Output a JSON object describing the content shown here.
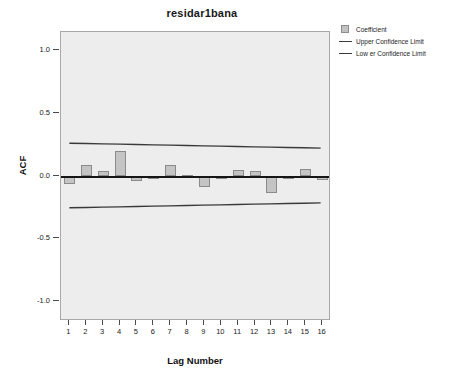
{
  "chart_data": {
    "type": "bar",
    "title": "residar1bana",
    "xlabel": "Lag Number",
    "ylabel": "ACF",
    "grid": false,
    "legend_position": "top-right",
    "xlim": [
      0.5,
      16.5
    ],
    "ylim": [
      -1.15,
      1.15
    ],
    "ytick_values": [
      1.0,
      0.5,
      0.0,
      -0.5,
      -1.0
    ],
    "ytick_labels": [
      "1.0",
      "0.5",
      "0.0",
      "-0.5",
      "-1.0"
    ],
    "categories": [
      1,
      2,
      3,
      4,
      5,
      6,
      7,
      8,
      9,
      10,
      11,
      12,
      13,
      14,
      15,
      16
    ],
    "xtick_labels": [
      "1",
      "2",
      "3",
      "4",
      "5",
      "6",
      "7",
      "8",
      "9",
      "10",
      "11",
      "12",
      "13",
      "14",
      "15",
      "16"
    ],
    "series": [
      {
        "name": "Coefficient",
        "type": "bar",
        "color": "#c4c4c4",
        "edge_color": "#8a8a8a",
        "values": [
          -0.06,
          0.09,
          0.045,
          0.205,
          -0.035,
          -0.01,
          0.095,
          0.012,
          -0.085,
          -0.008,
          0.05,
          0.042,
          -0.135,
          -0.015,
          0.06,
          -0.025
        ]
      },
      {
        "name": "Upper Confidence Limit",
        "type": "line",
        "color": "#3a3a3a",
        "values": [
          0.258,
          0.256,
          0.253,
          0.251,
          0.248,
          0.245,
          0.243,
          0.24,
          0.237,
          0.235,
          0.232,
          0.229,
          0.227,
          0.224,
          0.222,
          0.219
        ]
      },
      {
        "name": "Lower Confidence Limit",
        "type": "line",
        "color": "#3a3a3a",
        "values": [
          -0.258,
          -0.256,
          -0.253,
          -0.251,
          -0.248,
          -0.245,
          -0.243,
          -0.24,
          -0.237,
          -0.235,
          -0.232,
          -0.229,
          -0.227,
          -0.224,
          -0.222,
          -0.219
        ]
      }
    ]
  },
  "legend": {
    "items": [
      {
        "label": "Coefficient",
        "key": "swatch"
      },
      {
        "label": "Upper Confidence Limit",
        "key": "line"
      },
      {
        "label": "Low er Confidence Limit",
        "key": "line"
      }
    ]
  }
}
